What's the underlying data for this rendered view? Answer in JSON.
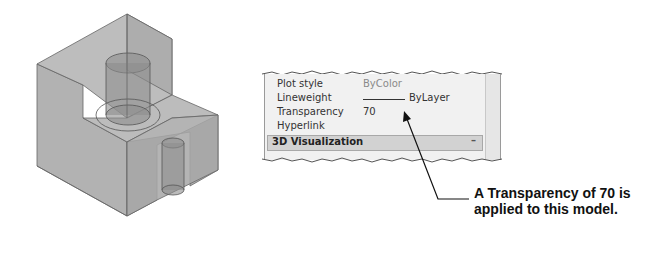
{
  "properties_panel": {
    "rows": [
      {
        "label": "Plot style",
        "value": "ByColor"
      },
      {
        "label": "Lineweight",
        "value": "ByLayer"
      },
      {
        "label": "Transparency",
        "value": "70"
      },
      {
        "label": "Hyperlink",
        "value": ""
      }
    ],
    "section": {
      "title": "3D Visualization",
      "toggle": "–"
    }
  },
  "callout": {
    "text": "A Transparency of 70 is applied to this model."
  },
  "model": {
    "description": "Transparent 3D block with cylindrical holes",
    "fill_color": "#a6a6a6"
  }
}
